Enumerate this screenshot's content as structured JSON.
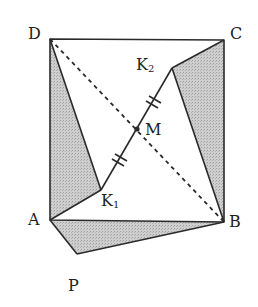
{
  "diagram": {
    "title": "",
    "colors": {
      "stroke": "#2a2a2a",
      "shade": "#c6c6c6",
      "background": "#ffffff"
    },
    "points": {
      "D": {
        "x": 50,
        "y": 39,
        "label": "D"
      },
      "C": {
        "x": 224,
        "y": 40,
        "label": "C"
      },
      "A": {
        "x": 50,
        "y": 220,
        "label": "A"
      },
      "B": {
        "x": 224,
        "y": 222,
        "label": "B"
      },
      "K1": {
        "x": 101,
        "y": 190,
        "label": "K",
        "sub": "1"
      },
      "K2": {
        "x": 172,
        "y": 68,
        "label": "K",
        "sub": "2"
      },
      "M": {
        "x": 137,
        "y": 129,
        "label": "M"
      },
      "P": {
        "x": 77,
        "y": 270,
        "label": "P"
      }
    },
    "shaded_regions": [
      {
        "name": "triangle-D-K1-A",
        "vertices": [
          "D",
          "K1",
          "A"
        ]
      },
      {
        "name": "triangle-C-K2-B",
        "vertices": [
          "C",
          "K2",
          "B"
        ]
      },
      {
        "name": "triangle-A-P-B",
        "vertices": [
          "A",
          "P",
          "B"
        ]
      }
    ],
    "segments": [
      {
        "from": "D",
        "to": "C",
        "style": "solid"
      },
      {
        "from": "C",
        "to": "B",
        "style": "solid"
      },
      {
        "from": "B",
        "to": "A",
        "style": "solid"
      },
      {
        "from": "A",
        "to": "D",
        "style": "solid"
      },
      {
        "from": "D",
        "to": "K1",
        "style": "solid"
      },
      {
        "from": "K1",
        "to": "A",
        "style": "solid"
      },
      {
        "from": "C",
        "to": "K2",
        "style": "solid"
      },
      {
        "from": "K2",
        "to": "B",
        "style": "solid"
      },
      {
        "from": "A",
        "to": "P",
        "style": "solid"
      },
      {
        "from": "P",
        "to": "B",
        "style": "solid"
      },
      {
        "from": "K1",
        "to": "K2",
        "style": "solid"
      },
      {
        "from": "D",
        "to": "B",
        "style": "dashed"
      }
    ],
    "equal_marks": [
      {
        "segment": "K1-M",
        "ticks": 2
      },
      {
        "segment": "M-K2",
        "ticks": 2
      }
    ]
  }
}
